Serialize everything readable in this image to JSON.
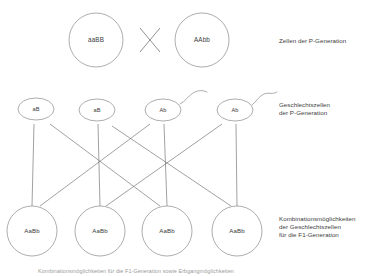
{
  "diagram": {
    "title_caption": "Kombinationsmöglichkeiten für die F1-Generation sowie Erbgangmöglichkeiten",
    "stroke_color": "#8a8a8a",
    "text_color": "#3a3a3a",
    "background": "#ffffff",
    "p_generation": {
      "row_label": "Zellen der P-Generation",
      "cross_symbol": "X",
      "cells": [
        {
          "genotype": "aaBB",
          "cx": 96,
          "cy": 40,
          "r": 27
        },
        {
          "genotype": "AAbb",
          "cx": 202,
          "cy": 40,
          "r": 27
        }
      ]
    },
    "gametes": {
      "row_label_line1": "Geschlechtszellen",
      "row_label_line2": "der P-Generation",
      "cells": [
        {
          "genotype": "aB",
          "cx": 36,
          "cy": 109,
          "rx": 18,
          "ry": 11,
          "tail": false
        },
        {
          "genotype": "aB",
          "cx": 97,
          "cy": 110,
          "rx": 18,
          "ry": 11,
          "tail": false
        },
        {
          "genotype": "Ab",
          "cx": 163,
          "cy": 110,
          "rx": 18,
          "ry": 11,
          "tail": true
        },
        {
          "genotype": "Ab",
          "cx": 235,
          "cy": 110,
          "rx": 18,
          "ry": 11,
          "tail": true
        }
      ]
    },
    "f1_generation": {
      "row_label_line1": "Kombinationsmöglichkeiten",
      "row_label_line2": "der Geschlechtszellen",
      "row_label_line3": "für die F1-Generation",
      "cells": [
        {
          "genotype": "AaBb",
          "cx": 32,
          "cy": 231,
          "r": 25
        },
        {
          "genotype": "AaBb",
          "cx": 100,
          "cy": 231,
          "r": 25
        },
        {
          "genotype": "AaBb",
          "cx": 167,
          "cy": 231,
          "r": 25
        },
        {
          "genotype": "AaBb",
          "cx": 237,
          "cy": 231,
          "r": 25
        }
      ]
    },
    "connections": [
      {
        "from": 0,
        "to": 0,
        "type": "vertical"
      },
      {
        "from": 0,
        "to": 2,
        "type": "diagonal"
      },
      {
        "from": 1,
        "to": 1,
        "type": "vertical"
      },
      {
        "from": 1,
        "to": 3,
        "type": "diagonal"
      },
      {
        "from": 2,
        "to": 2,
        "type": "vertical"
      },
      {
        "from": 2,
        "to": 0,
        "type": "diagonal"
      },
      {
        "from": 3,
        "to": 3,
        "type": "vertical"
      },
      {
        "from": 3,
        "to": 1,
        "type": "diagonal"
      }
    ]
  }
}
